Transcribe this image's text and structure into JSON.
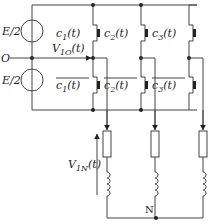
{
  "diagram": {
    "type": "three-phase two-level voltage source inverter",
    "sources": [
      {
        "label": "E/2",
        "position": "upper"
      },
      {
        "label": "E/2",
        "position": "lower"
      }
    ],
    "midpoint_label": "O",
    "voltage_label": {
      "main": "V",
      "sub": "1O",
      "arg": "(t)"
    },
    "load_voltage_label": {
      "main": "V",
      "sub": "1N",
      "arg": "(t)"
    },
    "neutral_label": "N",
    "switches": {
      "upper": [
        {
          "main": "c",
          "sub": "1",
          "arg": "(t)"
        },
        {
          "main": "c",
          "sub": "2",
          "arg": "(t)"
        },
        {
          "main": "c",
          "sub": "3",
          "arg": "(t)"
        }
      ],
      "lower": [
        {
          "main": "c",
          "sub": "1",
          "arg": "(t)",
          "overline": true
        },
        {
          "main": "c",
          "sub": "2",
          "arg": "(t)",
          "overline": true
        },
        {
          "main": "c",
          "sub": "3",
          "arg": "(t)",
          "overline": true
        }
      ]
    },
    "loads": [
      {
        "phase": 1,
        "components": [
          "resistor",
          "inductor"
        ]
      },
      {
        "phase": 2,
        "components": [
          "resistor",
          "inductor"
        ]
      },
      {
        "phase": 3,
        "components": [
          "resistor",
          "inductor"
        ]
      }
    ],
    "colors": {
      "wire": "#444444",
      "text": "#222222",
      "background": "#ffffff"
    }
  }
}
